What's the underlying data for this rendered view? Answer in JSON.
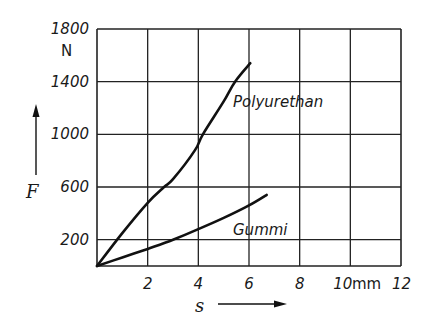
{
  "chart_data": {
    "type": "line",
    "title": "",
    "xlabel": "s",
    "ylabel": "F",
    "x_unit": "mm",
    "y_unit": "N",
    "xlim": [
      0,
      12
    ],
    "ylim": [
      0,
      1800
    ],
    "grid": true,
    "x_ticks": [
      2,
      4,
      6,
      8,
      10,
      12
    ],
    "x_tick_labels": [
      "2",
      "4",
      "6",
      "8",
      "10",
      "12"
    ],
    "y_ticks": [
      200,
      600,
      1000,
      1400,
      1800
    ],
    "y_tick_labels": [
      "200",
      "600",
      "1000",
      "1400",
      "1800"
    ],
    "x_grid": [
      0,
      2,
      4,
      6,
      8,
      10,
      12
    ],
    "y_grid": [
      0,
      200,
      600,
      1000,
      1400,
      1800
    ],
    "series": [
      {
        "name": "Polyurethan",
        "x": [
          0,
          1,
          2,
          2.65,
          3,
          3.87,
          4.18,
          5,
          5.45,
          6.05
        ],
        "y": [
          0,
          250,
          480,
          600,
          660,
          880,
          1000,
          1250,
          1400,
          1540
        ]
      },
      {
        "name": "Gummi",
        "x": [
          0,
          1,
          2,
          3,
          4,
          5,
          6,
          6.7
        ],
        "y": [
          0,
          65,
          130,
          200,
          280,
          365,
          460,
          540
        ]
      }
    ],
    "annotations": [
      {
        "text": "Polyurethan",
        "near_series": "Polyurethan"
      },
      {
        "text": "Gummi",
        "near_series": "Gummi"
      }
    ],
    "legend": "none (inline curve labels)"
  }
}
